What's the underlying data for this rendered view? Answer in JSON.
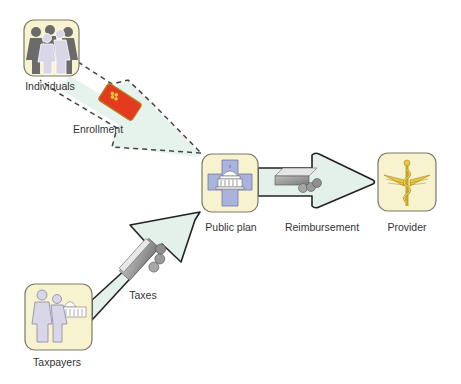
{
  "diagram": {
    "nodes": [
      {
        "id": "individuals",
        "label": "Individuals",
        "icon": "people-group-icon"
      },
      {
        "id": "public_plan",
        "label": "Public plan",
        "icon": "government-cross-icon"
      },
      {
        "id": "provider",
        "label": "Provider",
        "icon": "caduceus-icon"
      },
      {
        "id": "taxpayers",
        "label": "Taxpayers",
        "icon": "couple-capitol-icon"
      }
    ],
    "edges": [
      {
        "from": "individuals",
        "to": "public_plan",
        "label": "Enrollment",
        "style": "dashed",
        "icon": "insurance-card-icon"
      },
      {
        "from": "public_plan",
        "to": "provider",
        "label": "Reimbursement",
        "style": "solid",
        "icon": "money-icon"
      },
      {
        "from": "taxpayers",
        "to": "public_plan",
        "label": "Taxes",
        "style": "solid",
        "icon": "money-icon"
      }
    ]
  },
  "labels": {
    "individuals": "Individuals",
    "enrollment": "Enrollment",
    "public_plan": "Public plan",
    "reimbursement": "Reimbursement",
    "provider": "Provider",
    "taxes": "Taxes",
    "taxpayers": "Taxpayers"
  },
  "colors": {
    "box_fill": "#f7f3cf",
    "box_stroke": "#7a7a6a",
    "arrow_fill": "#e3f1ea",
    "arrow_stroke": "#333333",
    "card_red": "#e23b1f",
    "card_yellow": "#f5c53a",
    "cross_blue": "#a9b3de",
    "caduceus_gold": "#e8c640",
    "people_dark": "#6b6b6b",
    "people_light": "#d9d6e8"
  }
}
